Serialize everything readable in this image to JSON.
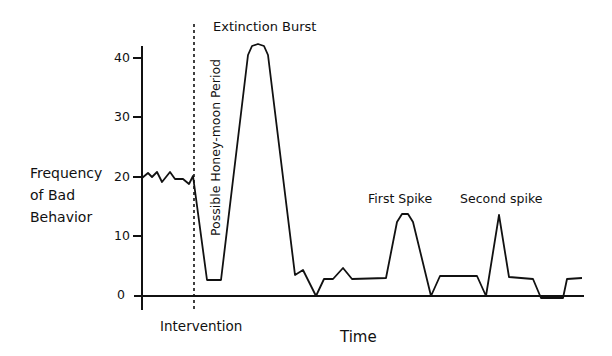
{
  "chart_data": {
    "type": "line",
    "title": "",
    "xlabel": "Time",
    "ylabel": "Frequency of Bad Behavior",
    "ylabel_lines": [
      "Frequency",
      "of Bad",
      "Behavior"
    ],
    "yticks": [
      0,
      10,
      20,
      30,
      40
    ],
    "ylim": [
      0,
      45
    ],
    "grid": false,
    "legend": null,
    "annotations": [
      {
        "text": "Extinction Burst",
        "x": 213,
        "y": 28
      },
      {
        "text": "Possible Honey-moon Period",
        "rotated": true
      },
      {
        "text": "First Spike",
        "x": 368,
        "y": 201
      },
      {
        "text": "Second spike",
        "x": 460,
        "y": 201
      },
      {
        "text": "Intervention",
        "x": 160,
        "y": 328
      }
    ],
    "intervention_x": 193,
    "points_px": [
      [
        142,
        178
      ],
      [
        148,
        173
      ],
      [
        152,
        177
      ],
      [
        157,
        172
      ],
      [
        162,
        182
      ],
      [
        170,
        172
      ],
      [
        175,
        179
      ],
      [
        183,
        179
      ],
      [
        189,
        184
      ],
      [
        193,
        176
      ],
      [
        207,
        280
      ],
      [
        221,
        280
      ],
      [
        248,
        55
      ],
      [
        252,
        46
      ],
      [
        258,
        44
      ],
      [
        264,
        46
      ],
      [
        268,
        55
      ],
      [
        295,
        275
      ],
      [
        303,
        270
      ],
      [
        316,
        296
      ],
      [
        324,
        279
      ],
      [
        333,
        279
      ],
      [
        343,
        268
      ],
      [
        352,
        279
      ],
      [
        386,
        278
      ],
      [
        397,
        222
      ],
      [
        402,
        214
      ],
      [
        408,
        214
      ],
      [
        413,
        222
      ],
      [
        431,
        296
      ],
      [
        440,
        276
      ],
      [
        477,
        276
      ],
      [
        486,
        296
      ],
      [
        499,
        215
      ],
      [
        509,
        277
      ],
      [
        533,
        279
      ],
      [
        541,
        298
      ],
      [
        563,
        298
      ],
      [
        567,
        279
      ],
      [
        582,
        278
      ]
    ],
    "series": [
      {
        "name": "Bad behavior frequency",
        "values": [
          20,
          20.8,
          20.2,
          21,
          19.3,
          21,
          19.8,
          19.8,
          19,
          20.3,
          2.7,
          2.7,
          40.5,
          42,
          42.3,
          42,
          40.5,
          3.5,
          4.3,
          0,
          2.8,
          2.8,
          4.7,
          2.8,
          3,
          12.4,
          13.8,
          13.8,
          12.4,
          0,
          3.4,
          3.4,
          0,
          13.6,
          3.2,
          2.8,
          0,
          0,
          2.9,
          3
        ]
      }
    ]
  }
}
